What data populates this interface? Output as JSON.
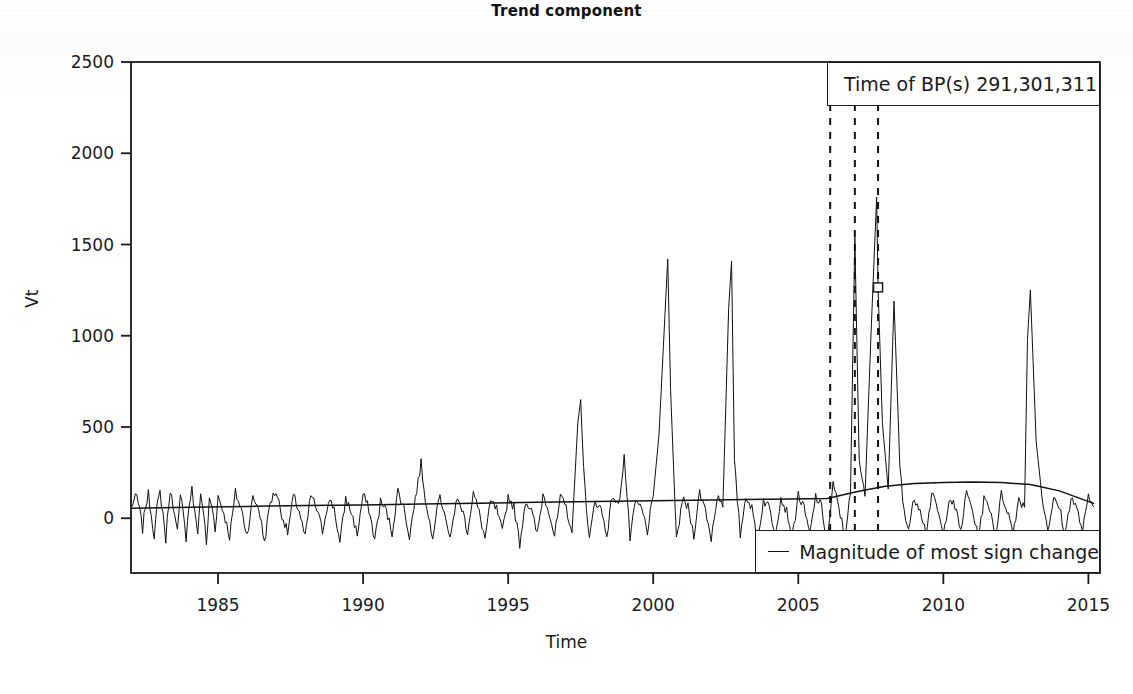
{
  "chart_data": {
    "type": "line",
    "title": "Trend component",
    "xlabel": "Time",
    "ylabel": "Vt",
    "xlim": [
      1982.0,
      2015.4
    ],
    "ylim": [
      -300,
      2500
    ],
    "xticks": [
      1985,
      1990,
      1995,
      2000,
      2005,
      2010,
      2015
    ],
    "yticks": [
      0,
      500,
      1000,
      1500,
      2000,
      2500
    ],
    "grid": false,
    "legend_position": "bottom-right",
    "breakpoints_label": "Time of BP(s) 291,301,311",
    "breakpoints_times": [
      2006.1,
      2006.95,
      2007.75
    ],
    "breakpoint_marker": {
      "x": 2007.75,
      "y": 1265
    },
    "series": [
      {
        "name": "Vt",
        "style": "solid-thin",
        "comment": "noisy seasonal residual-like series with sharp positive spikes",
        "x": [
          1982.0,
          1982.1,
          1982.2,
          1982.3,
          1982.4,
          1982.5,
          1982.6,
          1982.7,
          1982.8,
          1982.9,
          1983.0,
          1983.1,
          1983.2,
          1983.3,
          1983.4,
          1983.5,
          1983.6,
          1983.7,
          1983.8,
          1983.9,
          1984.0,
          1984.1,
          1984.2,
          1984.3,
          1984.4,
          1984.5,
          1984.6,
          1984.7,
          1984.8,
          1984.9,
          1985.0,
          1985.2,
          1985.4,
          1985.6,
          1985.8,
          1986.0,
          1986.2,
          1986.4,
          1986.6,
          1986.8,
          1987.0,
          1987.2,
          1987.4,
          1987.6,
          1987.8,
          1988.0,
          1988.2,
          1988.4,
          1988.6,
          1988.8,
          1989.0,
          1989.2,
          1989.4,
          1989.6,
          1989.8,
          1990.0,
          1990.2,
          1990.4,
          1990.6,
          1990.8,
          1991.0,
          1991.2,
          1991.4,
          1991.6,
          1991.8,
          1992.0,
          1992.2,
          1992.4,
          1992.6,
          1992.8,
          1993.0,
          1993.2,
          1993.4,
          1993.6,
          1993.8,
          1994.0,
          1994.2,
          1994.4,
          1994.6,
          1994.8,
          1995.0,
          1995.2,
          1995.4,
          1995.6,
          1995.8,
          1996.0,
          1996.2,
          1996.4,
          1996.6,
          1996.8,
          1997.0,
          1997.2,
          1997.4,
          1997.5,
          1997.6,
          1997.8,
          1998.0,
          1998.2,
          1998.4,
          1998.6,
          1998.8,
          1999.0,
          1999.2,
          1999.4,
          1999.6,
          1999.8,
          2000.0,
          2000.2,
          2000.4,
          2000.5,
          2000.6,
          2000.8,
          2001.0,
          2001.2,
          2001.4,
          2001.6,
          2001.8,
          2002.0,
          2002.2,
          2002.4,
          2002.6,
          2002.7,
          2002.8,
          2003.0,
          2003.2,
          2003.4,
          2003.6,
          2003.8,
          2004.0,
          2004.2,
          2004.4,
          2004.6,
          2004.8,
          2005.0,
          2005.2,
          2005.4,
          2005.6,
          2005.8,
          2006.0,
          2006.2,
          2006.4,
          2006.6,
          2006.8,
          2006.95,
          2007.1,
          2007.3,
          2007.5,
          2007.7,
          2007.75,
          2007.9,
          2008.1,
          2008.3,
          2008.5,
          2008.6,
          2008.8,
          2009.0,
          2009.2,
          2009.4,
          2009.6,
          2009.8,
          2010.0,
          2010.2,
          2010.4,
          2010.6,
          2010.8,
          2011.0,
          2011.2,
          2011.4,
          2011.6,
          2011.8,
          2012.0,
          2012.2,
          2012.4,
          2012.6,
          2012.8,
          2012.9,
          2013.0,
          2013.2,
          2013.4,
          2013.6,
          2013.8,
          2014.0,
          2014.2,
          2014.4,
          2014.6,
          2014.8,
          2015.0,
          2015.2
        ],
        "y": [
          60,
          95,
          120,
          40,
          -60,
          70,
          130,
          20,
          -90,
          60,
          140,
          30,
          -120,
          90,
          150,
          10,
          -80,
          110,
          60,
          -110,
          70,
          160,
          20,
          -70,
          130,
          40,
          -150,
          100,
          60,
          -60,
          120,
          30,
          -100,
          140,
          50,
          -90,
          110,
          60,
          -130,
          90,
          150,
          20,
          -80,
          120,
          40,
          -110,
          130,
          50,
          -70,
          100,
          60,
          -140,
          110,
          30,
          -90,
          130,
          50,
          -120,
          90,
          40,
          -80,
          150,
          60,
          -100,
          110,
          300,
          40,
          -90,
          120,
          50,
          -130,
          100,
          60,
          -70,
          140,
          30,
          -110,
          90,
          50,
          -80,
          120,
          60,
          -140,
          100,
          40,
          -90,
          130,
          50,
          -100,
          110,
          60,
          -80,
          520,
          650,
          260,
          -120,
          100,
          50,
          -90,
          130,
          60,
          340,
          -110,
          90,
          50,
          -70,
          120,
          460,
          1100,
          1420,
          700,
          -130,
          100,
          60,
          -90,
          140,
          50,
          -110,
          120,
          60,
          1150,
          1410,
          300,
          -90,
          130,
          50,
          -120,
          100,
          60,
          -80,
          110,
          40,
          -100,
          130,
          50,
          -90,
          120,
          60,
          -130,
          180,
          60,
          -100,
          140,
          1540,
          300,
          120,
          980,
          1760,
          1265,
          520,
          160,
          1190,
          300,
          90,
          -60,
          110,
          60,
          -80,
          130,
          50,
          -100,
          120,
          60,
          -70,
          140,
          50,
          -110,
          100,
          60,
          -90,
          130,
          50,
          -80,
          110,
          60,
          980,
          1250,
          420,
          120,
          -60,
          100,
          60,
          -90,
          120,
          50,
          -70,
          110,
          60
        ]
      },
      {
        "name": "Magnitude of most sign change",
        "style": "solid-smooth",
        "comment": "smooth slowly varying trend level line",
        "x": [
          1982,
          1984,
          1986,
          1988,
          1990,
          1992,
          1994,
          1996,
          1998,
          2000,
          2002,
          2004,
          2006,
          2007,
          2008,
          2009,
          2010,
          2011,
          2012,
          2013,
          2014,
          2015.2
        ],
        "y": [
          55,
          60,
          65,
          70,
          72,
          78,
          82,
          88,
          92,
          96,
          100,
          104,
          108,
          145,
          175,
          190,
          196,
          198,
          196,
          185,
          150,
          80
        ]
      }
    ],
    "legend": [
      {
        "label": "Magnitude of most sign change",
        "marker": "line"
      }
    ]
  },
  "title": {
    "text": "Trend component"
  },
  "axes": {
    "y_label": "Vt",
    "x_label": "Time",
    "y_ticks": [
      "0",
      "500",
      "1000",
      "1500",
      "2000",
      "2500"
    ],
    "x_ticks": [
      "1985",
      "1990",
      "1995",
      "2000",
      "2005",
      "2010",
      "2015"
    ]
  },
  "annotations": {
    "bp_box_text": "Time of BP(s) 291,301,311",
    "legend_text": "Magnitude of most sign change"
  },
  "colors": {
    "line": "#111111",
    "axis": "#1a1a1a",
    "background": "#fdfdfd",
    "plot_background": "#ffffff"
  }
}
